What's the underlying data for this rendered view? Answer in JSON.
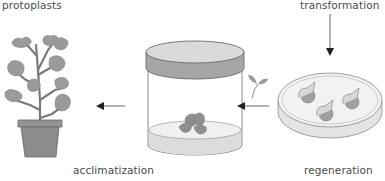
{
  "diagram": {
    "labels": {
      "protoplasts": "protoplasts",
      "transformation": "transformation",
      "regeneration": "regeneration",
      "acclimatization": "acclimatization"
    },
    "stages": [
      {
        "id": "petri-dish",
        "description": "Petri dish with regenerating protoplasts / calli"
      },
      {
        "id": "seedling",
        "description": "Small regenerated shoot"
      },
      {
        "id": "culture-jar",
        "description": "Culture jar with plantlet on medium"
      },
      {
        "id": "potted-plant",
        "description": "Acclimatized potted plant"
      }
    ],
    "arrows": [
      {
        "from": "transformation",
        "to": "petri-dish",
        "direction": "down"
      },
      {
        "from": "petri-dish",
        "to": "culture-jar",
        "direction": "left"
      },
      {
        "from": "culture-jar",
        "to": "potted-plant",
        "direction": "left"
      }
    ],
    "colors": {
      "text": "#4a4a4a",
      "leaf": "#9a9a9a",
      "stem": "#808080",
      "pot": "#8c8c8c",
      "jar_lid": "#a6a6a6",
      "jar_lid_top": "#dadada",
      "medium": "#e6e6e6",
      "outline": "#6a6a6a",
      "arrow": "#333333"
    }
  }
}
